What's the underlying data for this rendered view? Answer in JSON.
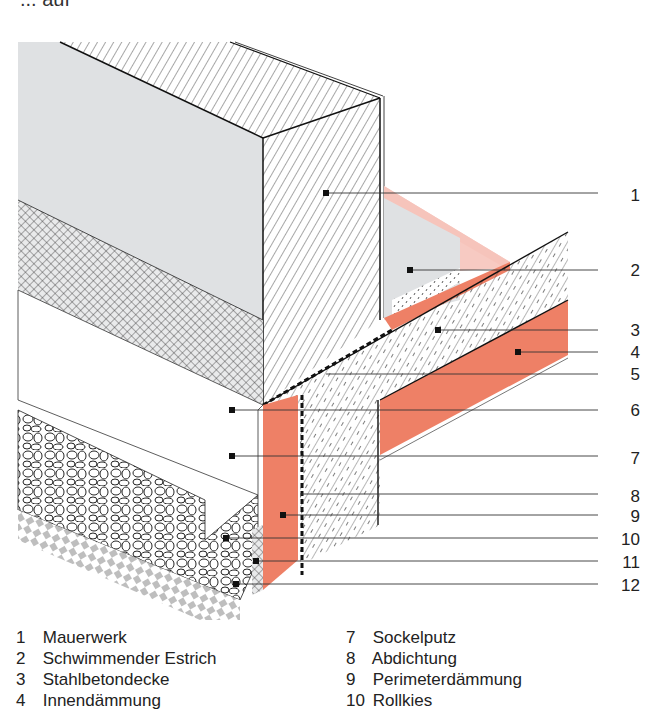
{
  "title_cut": "... auf",
  "diagram": {
    "colors": {
      "insulation": "#ee8066",
      "insulation_light": "#f6c4bb",
      "grey_fill": "#dfe1e3",
      "line": "#1a1a1a"
    },
    "callouts": [
      {
        "num": "1",
        "y": 196
      },
      {
        "num": "2",
        "y": 270
      },
      {
        "num": "3",
        "y": 330
      },
      {
        "num": "4",
        "y": 352
      },
      {
        "num": "5",
        "y": 374
      },
      {
        "num": "6",
        "y": 410
      },
      {
        "num": "7",
        "y": 458
      },
      {
        "num": "8",
        "y": 498
      },
      {
        "num": "9",
        "y": 520
      },
      {
        "num": "10",
        "y": 542
      },
      {
        "num": "11",
        "y": 564
      },
      {
        "num": "12",
        "y": 586
      }
    ]
  },
  "legend": {
    "col1": [
      {
        "num": "1",
        "label": "Mauerwerk"
      },
      {
        "num": "2",
        "label": "Schwimmender Estrich"
      },
      {
        "num": "3",
        "label": "Stahlbetondecke"
      },
      {
        "num": "4",
        "label": "Innendämmung"
      }
    ],
    "col2": [
      {
        "num": "7",
        "label": "Sockelputz"
      },
      {
        "num": "8",
        "label": "Abdichtung"
      },
      {
        "num": "9",
        "label": "Perimeterdämmung"
      },
      {
        "num": "10",
        "label": "Rollkies"
      }
    ]
  }
}
